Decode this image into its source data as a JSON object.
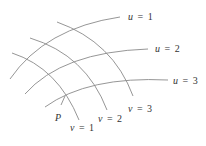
{
  "diagram": {
    "u_curves": [
      {
        "var": "u",
        "eq": "=",
        "val": "1"
      },
      {
        "var": "u",
        "eq": "=",
        "val": "2"
      },
      {
        "var": "u",
        "eq": "=",
        "val": "3"
      }
    ],
    "v_curves": [
      {
        "var": "v",
        "eq": "=",
        "val": "1"
      },
      {
        "var": "v",
        "eq": "=",
        "val": "2"
      },
      {
        "var": "v",
        "eq": "=",
        "val": "3"
      }
    ],
    "point_label": "P",
    "line_color": "#8a8a8a",
    "text_color": "#333333"
  }
}
